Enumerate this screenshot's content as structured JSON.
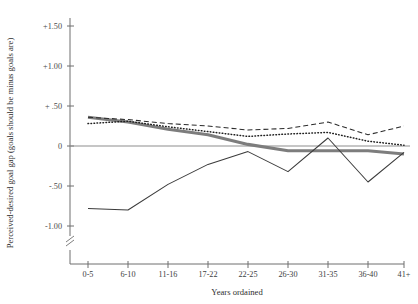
{
  "chart_data": {
    "type": "line",
    "title": "",
    "xlabel": "Years ordained",
    "ylabel": "Perceived-desired goal gap  (goals should be minus goals are)",
    "categories": [
      "0-5",
      "6-10",
      "11-16",
      "17-22",
      "22-25",
      "26-30",
      "31-35",
      "36-40",
      "41+"
    ],
    "ytick_labels": [
      "+1.50",
      "+1.00",
      "+  .50",
      "0",
      "-.50",
      "-1.00"
    ],
    "ytick_values": [
      1.5,
      1.0,
      0.5,
      0.0,
      -0.5,
      -1.0
    ],
    "ylim": [
      -1.2,
      1.72
    ],
    "grid": false,
    "legend": "none",
    "axis_break": true,
    "series": [
      {
        "name": "dashed-series",
        "style": "dashed",
        "values": [
          0.36,
          0.33,
          0.28,
          0.25,
          0.2,
          0.22,
          0.3,
          0.14,
          0.25
        ]
      },
      {
        "name": "dotted-series",
        "style": "dotted",
        "values": [
          0.28,
          0.31,
          0.24,
          0.18,
          0.12,
          0.15,
          0.17,
          0.06,
          0.01
        ]
      },
      {
        "name": "thick-solid-series",
        "style": "thick-solid",
        "values": [
          0.36,
          0.3,
          0.21,
          0.14,
          0.02,
          -0.06,
          -0.06,
          -0.06,
          -0.1
        ]
      },
      {
        "name": "thin-solid-series",
        "style": "thin-solid",
        "values": [
          -0.78,
          -0.8,
          -0.48,
          -0.23,
          -0.07,
          -0.32,
          0.1,
          -0.45,
          -0.08
        ]
      }
    ]
  }
}
